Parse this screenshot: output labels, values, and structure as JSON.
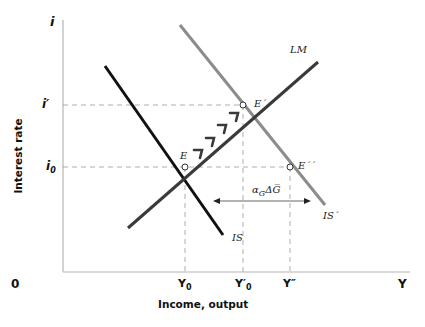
{
  "diagram": {
    "type": "IS-LM",
    "axes": {
      "y_axis_symbol": "i",
      "x_axis_symbol": "Y",
      "origin": "0",
      "y_axis_title": "Interest rate",
      "x_axis_title": "Income, output"
    },
    "y_ticks": [
      {
        "label": "i′",
        "sub": ""
      },
      {
        "label": "i",
        "sub": "0"
      }
    ],
    "x_ticks": [
      {
        "label": "Y",
        "sub": "0"
      },
      {
        "label": "Y′",
        "sub": "0"
      },
      {
        "label": "Y″",
        "sub": ""
      }
    ],
    "curves": [
      {
        "name": "IS",
        "color": "#111111"
      },
      {
        "name": "IS´",
        "color": "#8c8c8c"
      },
      {
        "name": "LM",
        "color": "#3a3a3a"
      }
    ],
    "points": [
      {
        "name": "E"
      },
      {
        "name": "E´"
      },
      {
        "name": "E´´"
      }
    ],
    "shift_annotation": "α",
    "shift_annotation_sub": "G",
    "shift_annotation_rest": "ΔG̅"
  }
}
